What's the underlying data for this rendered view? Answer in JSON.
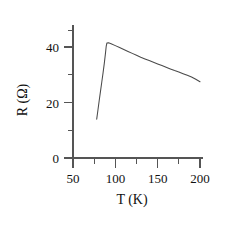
{
  "chart_data": {
    "type": "line",
    "title": "",
    "subtitle": "",
    "xlabel": "T (K)",
    "ylabel": "R (Ω)",
    "xlim": [
      45,
      207
    ],
    "ylim": [
      -2,
      50
    ],
    "grid": false,
    "legend": null,
    "x_major_ticks": [
      50,
      100,
      150,
      200
    ],
    "x_major_tick_labels": [
      "50",
      "100",
      "150",
      "200"
    ],
    "x_minor_ticks": [
      75,
      125,
      175
    ],
    "y_major_ticks": [
      0,
      20,
      40
    ],
    "y_major_tick_labels": [
      "0",
      "20",
      "40"
    ],
    "y_minor_ticks": [
      10,
      30,
      50
    ],
    "series": [
      {
        "name": "R(T)",
        "color": "#4a4a4a",
        "x": [
          78.0,
          79.5,
          81.0,
          82.5,
          84.0,
          85.5,
          87.0,
          88.3,
          89.2,
          90.0,
          92.0,
          95.0,
          100.0,
          105.0,
          110.0,
          115.0,
          120.0,
          125.0,
          130.0,
          135.0,
          140.0,
          145.0,
          150.0,
          155.0,
          160.0,
          165.0,
          170.0,
          175.0,
          180.0,
          185.0,
          190.0,
          195.0,
          200.0
        ],
        "y": [
          14.0,
          17.4,
          20.8,
          24.1,
          27.4,
          30.7,
          34.2,
          37.6,
          40.2,
          41.4,
          41.5,
          41.2,
          40.5,
          39.8,
          39.1,
          38.4,
          37.7,
          37.0,
          36.3,
          35.7,
          35.1,
          34.5,
          33.9,
          33.3,
          32.7,
          32.1,
          31.5,
          31.0,
          30.4,
          29.8,
          29.2,
          28.4,
          27.5
        ]
      }
    ],
    "annotations": [],
    "notes": {
      "peak_temperature_K": 91,
      "peak_resistance_ohm": 41.5,
      "onset_temperature_K": 78,
      "onset_resistance_ohm": 14.0,
      "end_temperature_K": 200,
      "end_resistance_ohm": 27.5
    }
  },
  "axes": {
    "x_axis_name": "temperature-axis",
    "y_axis_name": "resistance-axis"
  }
}
